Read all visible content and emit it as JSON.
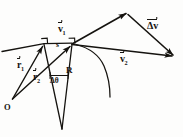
{
  "figure": {
    "stroke_color": "#15130f",
    "background_color": "#fdfdfc",
    "labels": {
      "v1": "v",
      "v1_sub": "1",
      "v2": "v",
      "v2_sub": "2",
      "delta_v": "Δv",
      "r1": "r",
      "r1_sub": "1",
      "r2": "r",
      "r2_sub": "2",
      "radius": "R",
      "arc_length": "s",
      "delta_theta": "Δθ",
      "origin": "O"
    },
    "geometry": {
      "origin_point": [
        12,
        99
      ],
      "point_1": [
        44,
        44
      ],
      "point_2": [
        72,
        44
      ],
      "circle_center": [
        62,
        129
      ],
      "v1_tip": [
        127,
        14
      ],
      "shared_vertex": [
        72,
        44
      ],
      "dv_tip": [
        174,
        56
      ],
      "v2_tip": [
        174,
        56
      ],
      "radius_value": "R",
      "angle_value": "Δθ"
    }
  }
}
